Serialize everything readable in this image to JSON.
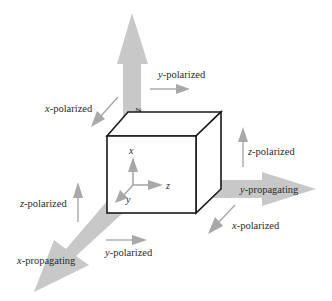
{
  "diagram": {
    "colors": {
      "big_arrow": "#c8c8c8",
      "small_arrow": "#a8a8a8",
      "cube_stroke": "#1a1a1a",
      "text": "#2a2a2a"
    },
    "axes": {
      "x": "x",
      "y": "y",
      "z": "z"
    },
    "propagation": {
      "z": {
        "axis": "z",
        "suffix": "-propagating"
      },
      "y": {
        "axis": "y",
        "suffix": "-propagating"
      },
      "x": {
        "axis": "x",
        "suffix": "-propagating"
      }
    },
    "polarization_labels": {
      "top_y": {
        "axis": "y",
        "suffix": "-polarized"
      },
      "top_x": {
        "axis": "x",
        "suffix": "-polarized"
      },
      "right_z": {
        "axis": "z",
        "suffix": "-polarized"
      },
      "right_x": {
        "axis": "x",
        "suffix": "-polarized"
      },
      "left_z": {
        "axis": "z",
        "suffix": "-polarized"
      },
      "bottom_y": {
        "axis": "y",
        "suffix": "-polarized"
      }
    }
  }
}
